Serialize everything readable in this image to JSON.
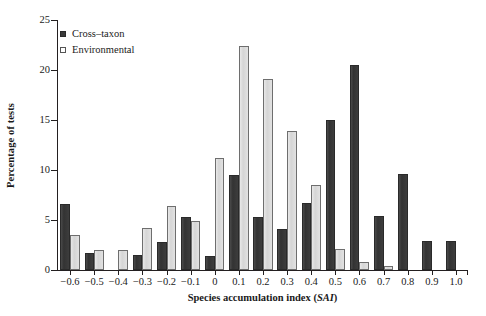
{
  "chart_data": {
    "type": "bar",
    "title": "",
    "xlabel": "Species accumulation index (SAI)",
    "ylabel": "Percentage of tests",
    "xlim": [
      -0.65,
      1.05
    ],
    "ylim": [
      0,
      25
    ],
    "yticks": [
      0,
      5,
      10,
      15,
      20,
      25
    ],
    "xticks": [
      -0.6,
      -0.5,
      -0.4,
      -0.3,
      -0.2,
      -0.1,
      0,
      0.1,
      0.2,
      0.3,
      0.4,
      0.5,
      0.6,
      0.7,
      0.8,
      0.9,
      1.0
    ],
    "xtick_labels": [
      "−0.6",
      "−0.5",
      "−0.4",
      "−0.3",
      "−0.2",
      "−0.1",
      "0",
      "0.1",
      "0.2",
      "0.3",
      "0.4",
      "0.5",
      "0.6",
      "0.7",
      "0.8",
      "0.9",
      "1.0"
    ],
    "ytick_labels": [
      "0",
      "5",
      "10",
      "15",
      "20",
      "25"
    ],
    "grid": false,
    "legend_position": "top-left",
    "categories": [
      "-0.6",
      "-0.5",
      "-0.4",
      "-0.3",
      "-0.2",
      "-0.1",
      "0",
      "0.1",
      "0.2",
      "0.3",
      "0.4",
      "0.5",
      "0.6",
      "0.7",
      "0.8",
      "0.9",
      "1.0"
    ],
    "series": [
      {
        "name": "Cross-taxon",
        "color": "#3a3a3a",
        "values": [
          6.6,
          1.7,
          0,
          1.5,
          2.8,
          5.3,
          1.4,
          9.5,
          5.3,
          4.1,
          6.7,
          15.0,
          20.5,
          5.4,
          9.6,
          2.9,
          2.9
        ]
      },
      {
        "name": "Environmental",
        "color": "#dcdcdc",
        "values": [
          3.5,
          2.0,
          2.0,
          4.2,
          6.4,
          4.9,
          11.2,
          22.4,
          19.1,
          13.9,
          8.5,
          2.1,
          0.8,
          0.4,
          0,
          0,
          0
        ]
      }
    ]
  },
  "legend": {
    "items": [
      {
        "label": "Cross–taxon",
        "style": "dark"
      },
      {
        "label": "Environmental",
        "style": "light"
      }
    ]
  },
  "axes": {
    "y_title": "Percentage of tests",
    "x_title_main": "Species accumulation index (",
    "x_title_italic": "SAI",
    "x_title_end": ")"
  }
}
